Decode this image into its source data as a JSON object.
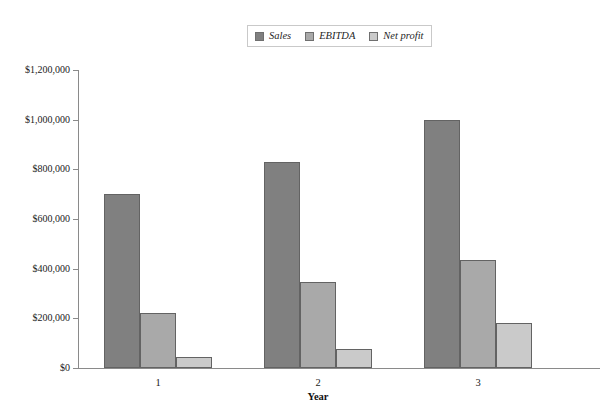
{
  "chart_data": {
    "type": "bar",
    "title": "",
    "xlabel": "Year",
    "ylabel": "",
    "categories": [
      "1",
      "2",
      "3"
    ],
    "series": [
      {
        "name": "Sales",
        "color": "#808080",
        "values": [
          700000,
          830000,
          1000000
        ]
      },
      {
        "name": "EBITDA",
        "color": "#a9a9a9",
        "values": [
          220000,
          345000,
          435000
        ]
      },
      {
        "name": "Net profit",
        "color": "#cacaca",
        "values": [
          45000,
          75000,
          180000
        ]
      }
    ],
    "ylim": [
      0,
      1200000
    ],
    "ytick_values": [
      0,
      200000,
      400000,
      600000,
      800000,
      1000000,
      1200000
    ],
    "ytick_labels": [
      "$0",
      "$200,000",
      "$400,000",
      "$600,000",
      "$800,000",
      "$1,000,000",
      "$1,200,000"
    ],
    "grid": false,
    "legend_position": "top-center",
    "legend_entries": [
      "Sales",
      "EBITDA",
      "Net profit"
    ]
  }
}
